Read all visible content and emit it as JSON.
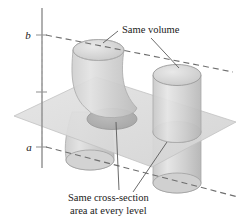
{
  "figure": {
    "name": "cavalieri-principle-diagram",
    "background_color": "#ffffff",
    "axis": {
      "label_upper": "b",
      "label_lower": "a",
      "line_color": "#8f8f8f"
    },
    "annotations": {
      "top": "Same volume",
      "bottom_line1": "Same cross-section",
      "bottom_line2": "area at every level"
    },
    "colors": {
      "plane_fill": "#dcdcdc",
      "plane_stroke": "#bfbfbf",
      "solid_fill": "#d7d7d7",
      "solid_stroke": "#a8a8a8",
      "cross_section_fill": "#b4b4b4",
      "dash_color": "#6e6e6e",
      "leader_color": "#5a5a5a",
      "text_color": "#1a1a1a"
    },
    "dashed_levels": [
      {
        "name": "level-b",
        "x1": 42,
        "y1": 35,
        "x2": 233,
        "y2": 72
      },
      {
        "name": "level-a",
        "x1": 42,
        "y1": 147,
        "x2": 238,
        "y2": 197
      }
    ],
    "solids": [
      {
        "name": "sheared-cylinder",
        "type": "oblique-curved-cylinder"
      },
      {
        "name": "straight-cylinder",
        "type": "right-circular-cylinder"
      }
    ]
  }
}
